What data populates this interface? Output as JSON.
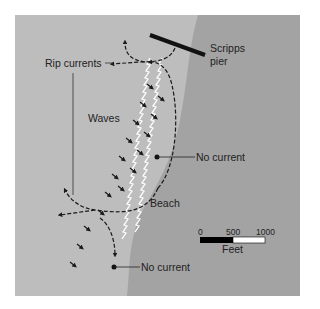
{
  "diagram": {
    "colors": {
      "ocean": "#bdbdbd",
      "land": "#a3a3a3",
      "ink": "#1a1a1a",
      "waves": "#ffffff"
    },
    "labels": {
      "rip_currents": "Rip currents",
      "waves": "Waves",
      "beach": "Beach",
      "pier_line1": "Scripps",
      "pier_line2": "pier",
      "no_current_upper": "No current",
      "no_current_lower": "No current"
    },
    "scale_bar": {
      "ticks": [
        "0",
        "500",
        "1000"
      ],
      "unit": "Feet"
    }
  }
}
